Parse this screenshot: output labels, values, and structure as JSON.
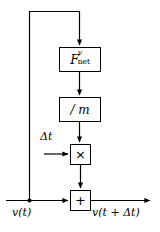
{
  "diagram": {
    "stroke_color": "#000000",
    "background_color": "#ffffff",
    "blocks": [
      {
        "id": "force",
        "symbol_base": "F",
        "symbol_superscript": "v",
        "symbol_subscript": "net",
        "shape": "rectangle"
      },
      {
        "id": "mass",
        "label": "/ m",
        "shape": "rectangle"
      },
      {
        "id": "multiply",
        "label": "×",
        "shape": "square"
      },
      {
        "id": "sum",
        "label": "+",
        "shape": "square"
      }
    ],
    "signals": {
      "input_label": "v(t)",
      "output_label": "v(t + Δt)",
      "timestep_label": "Δt"
    },
    "connections": [
      "v(t) tap feeds back up to F_net block",
      "F_net to /m",
      "/m to multiply",
      "delta-t into multiply",
      "multiply to sum",
      "v(t) into sum",
      "sum to v(t + delta t)"
    ]
  }
}
